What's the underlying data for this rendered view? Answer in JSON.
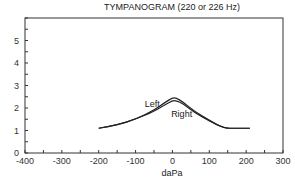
{
  "chart_data": {
    "type": "line",
    "title": "TYMPANOGRAM (220 or 226 Hz)",
    "xlabel": "daPa",
    "ylabel": "",
    "xlim": [
      -400,
      300
    ],
    "ylim": [
      0,
      6
    ],
    "xticks": [
      -400,
      -300,
      -200,
      -100,
      0,
      100,
      200,
      300
    ],
    "yticks": [
      0,
      1,
      2,
      3,
      4,
      5
    ],
    "grid": false,
    "legend": "inline annotations",
    "annotations": [
      {
        "text": "Left",
        "x": -55,
        "y": 2.05
      },
      {
        "text": "Right",
        "x": 25,
        "y": 1.6
      }
    ],
    "series": [
      {
        "name": "Left",
        "x": [
          -200,
          -150,
          -100,
          -50,
          -20,
          0,
          10,
          30,
          60,
          100,
          140,
          170,
          210
        ],
        "y": [
          1.1,
          1.25,
          1.5,
          1.9,
          2.25,
          2.45,
          2.45,
          2.25,
          1.85,
          1.45,
          1.1,
          1.1,
          1.1
        ]
      },
      {
        "name": "Right",
        "x": [
          -200,
          -150,
          -100,
          -50,
          -20,
          0,
          10,
          30,
          60,
          100,
          140,
          170,
          210
        ],
        "y": [
          1.1,
          1.25,
          1.5,
          1.85,
          2.15,
          2.32,
          2.33,
          2.18,
          1.8,
          1.42,
          1.1,
          1.1,
          1.1
        ]
      }
    ]
  }
}
